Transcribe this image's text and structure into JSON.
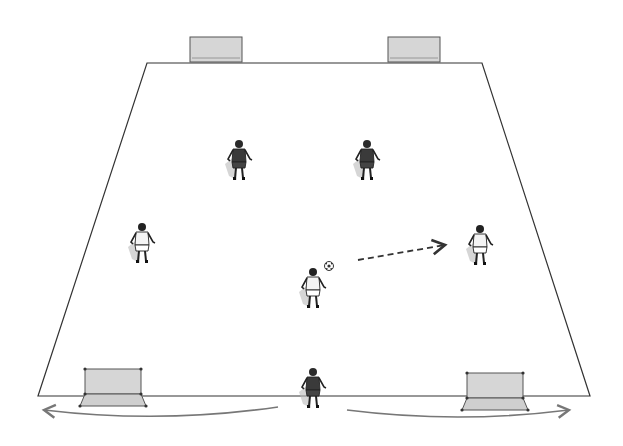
{
  "diagram": {
    "type": "soccer-drill",
    "field": {
      "shape": "trapezoid",
      "points": [
        [
          147,
          63
        ],
        [
          482,
          63
        ],
        [
          590,
          396
        ],
        [
          38,
          396
        ]
      ],
      "line_color": "#333333"
    },
    "goals": [
      {
        "id": "top-left-goal",
        "x": 190,
        "y": 37,
        "w": 52,
        "h": 25,
        "perspective": "far"
      },
      {
        "id": "top-right-goal",
        "x": 388,
        "y": 37,
        "w": 52,
        "h": 25,
        "perspective": "far"
      },
      {
        "id": "bottom-left-goal",
        "x": 80,
        "y": 369,
        "w": 66,
        "h": 37,
        "perspective": "near"
      },
      {
        "id": "bottom-right-goal",
        "x": 462,
        "y": 373,
        "w": 66,
        "h": 37,
        "perspective": "near"
      }
    ],
    "players": [
      {
        "id": "dark-player-top-left",
        "team": "dark",
        "x": 239,
        "y": 162
      },
      {
        "id": "dark-player-top-right",
        "team": "dark",
        "x": 367,
        "y": 162
      },
      {
        "id": "light-player-left",
        "team": "light",
        "x": 142,
        "y": 245
      },
      {
        "id": "light-player-right",
        "team": "light",
        "x": 480,
        "y": 247
      },
      {
        "id": "light-player-center",
        "team": "light",
        "x": 313,
        "y": 290
      },
      {
        "id": "dark-player-bottom",
        "team": "dark",
        "x": 313,
        "y": 390
      }
    ],
    "ball": {
      "x": 329,
      "y": 266
    },
    "pass_arrow": {
      "from": [
        358,
        260
      ],
      "to": [
        445,
        245
      ],
      "style": "dashed"
    },
    "movement_arrows": [
      {
        "id": "run-left",
        "from": [
          278,
          407
        ],
        "to": [
          44,
          410
        ],
        "style": "curved-solid"
      },
      {
        "id": "run-right",
        "from": [
          347,
          410
        ],
        "to": [
          569,
          410
        ],
        "style": "curved-solid"
      }
    ],
    "colors": {
      "dark_team": "#3a3a3a",
      "light_team": "#f4f4f4",
      "goal_fill": "#d6d6d6",
      "arrow": "#777777",
      "field_line": "#333333"
    }
  }
}
